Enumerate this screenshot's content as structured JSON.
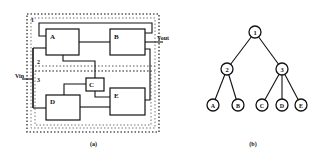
{
  "figure_a": {
    "caption": "(a)",
    "blocks": [
      {
        "id": "A",
        "label": "A"
      },
      {
        "id": "B",
        "label": "B"
      },
      {
        "id": "C",
        "label": "C"
      },
      {
        "id": "D",
        "label": "D"
      },
      {
        "id": "E",
        "label": "E"
      }
    ],
    "partitions": [
      {
        "id": "1",
        "label": "1"
      },
      {
        "id": "2",
        "label": "2"
      },
      {
        "id": "3",
        "label": "3"
      }
    ],
    "input_label": "Vin",
    "output_label": "Vout"
  },
  "figure_b": {
    "caption": "(b)",
    "nodes": [
      {
        "id": "1",
        "label": "1"
      },
      {
        "id": "2",
        "label": "2"
      },
      {
        "id": "3",
        "label": "3"
      },
      {
        "id": "A",
        "label": "A"
      },
      {
        "id": "B",
        "label": "B"
      },
      {
        "id": "C",
        "label": "C"
      },
      {
        "id": "D",
        "label": "D"
      },
      {
        "id": "E",
        "label": "E"
      }
    ],
    "edges": [
      [
        "1",
        "2"
      ],
      [
        "1",
        "3"
      ],
      [
        "2",
        "A"
      ],
      [
        "2",
        "B"
      ],
      [
        "3",
        "C"
      ],
      [
        "3",
        "D"
      ],
      [
        "3",
        "E"
      ]
    ]
  },
  "colors": {
    "stroke": "#111111",
    "dotted": "#555555",
    "background": "#ffffff"
  }
}
